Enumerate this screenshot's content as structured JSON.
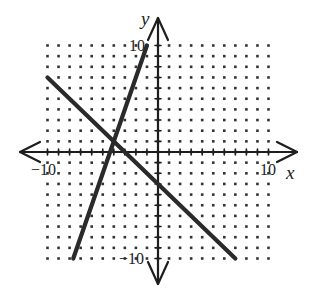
{
  "chart_data": {
    "type": "line",
    "title": "",
    "xlabel": "x",
    "ylabel": "y",
    "xlim": [
      -10,
      10
    ],
    "ylim": [
      -10,
      10
    ],
    "grid": "dots",
    "grid_step": 1,
    "tick_labels": {
      "x": [
        "-10",
        "10"
      ],
      "y": [
        "10",
        "-10"
      ]
    },
    "series": [
      {
        "name": "y = 3x + 13",
        "slope": 3,
        "intercept": 13,
        "points": [
          [
            -7.67,
            -10
          ],
          [
            -1,
            10
          ]
        ]
      },
      {
        "name": "y = -x - 3",
        "slope": -1,
        "intercept": -3,
        "points": [
          [
            -10,
            7
          ],
          [
            7,
            -10
          ]
        ]
      }
    ],
    "intersection": [
      -4,
      1
    ]
  },
  "labels": {
    "x_axis": "x",
    "y_axis": "y",
    "x_min": "−10",
    "x_max": "10",
    "y_max": "10",
    "y_min": "−10"
  },
  "colors": {
    "line": "#2a2a2a",
    "axis": "#1e1e1e",
    "dot": "#333333"
  }
}
